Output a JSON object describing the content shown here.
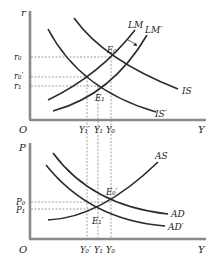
{
  "colors": {
    "axis": "#8a8a8a",
    "curve": "#2b2b2b",
    "guide": "#7a7a7a",
    "text": "#222222"
  },
  "top_panel": {
    "y_axis_label": "r",
    "x_axis_label": "Y",
    "origin_label": "O",
    "y_ticks": {
      "r0": "r₀",
      "r0_prime": "r₀′",
      "r1": "r₁"
    },
    "x_ticks": {
      "y1_prime": "Y₁′",
      "y1": "Y₁",
      "y0": "Y₀"
    },
    "curves": {
      "lm": "LM",
      "lm_prime": "LM′",
      "is": "IS",
      "is_prime": "IS′"
    },
    "points": {
      "e0": "E₀",
      "e1": "E₁"
    }
  },
  "bottom_panel": {
    "y_axis_label": "P",
    "x_axis_label": "Y",
    "origin_label": "O",
    "y_ticks": {
      "p0": "P₀",
      "p1": "P₁"
    },
    "x_ticks": {
      "y0_prime": "Y₀′",
      "y1": "Y₁",
      "y0": "Y₀"
    },
    "curves": {
      "as": "AS",
      "ad": "AD",
      "ad_prime": "AD′"
    },
    "points": {
      "e0_prime": "E₀′",
      "e1_prime": "E₁′"
    }
  }
}
